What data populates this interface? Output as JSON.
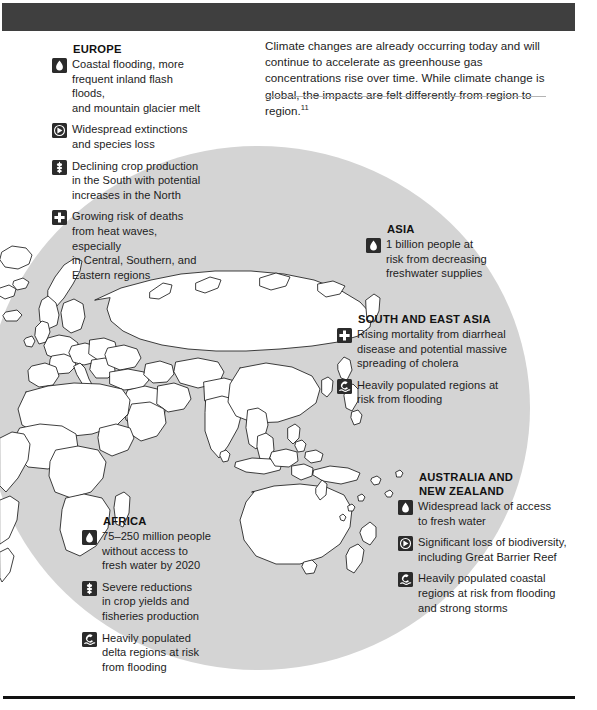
{
  "page": {
    "intro_paragraph": "Climate changes are already occurring today and will continue to accelerate as greenhouse gas concentrations rise over time. While climate change is global, the impacts are felt differently from region to region.",
    "intro_footnote": "11"
  },
  "colors": {
    "top_bar": "#3f3f3f",
    "ellipse_fill": "#d4d4d4",
    "icon_fill": "#2b2b2b",
    "text": "#1c1c1c",
    "rule": "#b4b4b4"
  },
  "regions": [
    {
      "id": "europe",
      "title": "EUROPE",
      "impacts": [
        {
          "icon": "water-drop-icon",
          "text": "Coastal flooding, more\nfrequent inland flash floods,\nand mountain glacier melt"
        },
        {
          "icon": "biodiversity-icon",
          "text": "Widespread extinctions\nand species loss"
        },
        {
          "icon": "crop-wheat-icon",
          "text": "Declining crop production\nin the South with potential\nincreases in the North"
        },
        {
          "icon": "health-cross-icon",
          "text": "Growing risk of deaths\nfrom heat waves, especially\nin Central, Southern, and\nEastern regions"
        }
      ]
    },
    {
      "id": "asia",
      "title": "ASIA",
      "impacts": [
        {
          "icon": "water-drop-icon",
          "text": "1 billion people at\nrisk from decreasing\nfreshwater supplies"
        }
      ]
    },
    {
      "id": "south-east-asia",
      "title": "SOUTH AND EAST ASIA",
      "impacts": [
        {
          "icon": "health-cross-icon",
          "text": "Rising mortality from diarrheal\ndisease and potential massive\nspreading of cholera"
        },
        {
          "icon": "flood-wave-icon",
          "text": "Heavily populated regions at\nrisk from flooding"
        }
      ]
    },
    {
      "id": "australia-nz",
      "title": "AUSTRALIA AND\nNEW ZEALAND",
      "impacts": [
        {
          "icon": "water-drop-icon",
          "text": "Widespread lack of access\nto fresh water"
        },
        {
          "icon": "biodiversity-icon",
          "text": "Significant loss of biodiversity,\nincluding Great Barrier Reef"
        },
        {
          "icon": "flood-wave-icon",
          "text": "Heavily populated coastal\nregions at risk from flooding\nand strong storms"
        }
      ]
    },
    {
      "id": "africa",
      "title": "AFRICA",
      "impacts": [
        {
          "icon": "water-drop-icon",
          "text": "75–250 million people\nwithout access to\nfresh water by 2020"
        },
        {
          "icon": "crop-wheat-icon",
          "text": "Severe reductions\nin crop yields and\nfisheries production"
        },
        {
          "icon": "flood-wave-icon",
          "text": "Heavily populated\ndelta regions at risk\nfrom flooding"
        }
      ]
    }
  ]
}
